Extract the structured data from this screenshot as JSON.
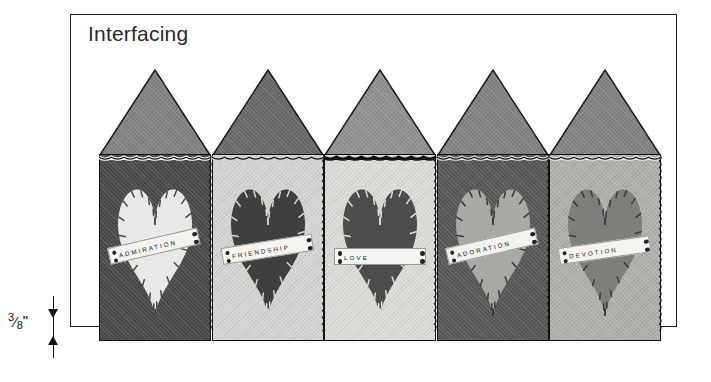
{
  "diagram": {
    "title": "Interfacing",
    "measurement": {
      "value": "3/8\"",
      "numerator": "3",
      "denominator": "8",
      "unit": "\""
    }
  },
  "panels": [
    {
      "index": 1,
      "label": "ADMIRATION",
      "body_color": "#4a4a4a",
      "roof_color": "#8a8a8a",
      "heart_color": "#e8e8e6",
      "stitch_color": "#4a4a4a",
      "scallop_color": "#ffffff",
      "tag_color": "#f2f2ee",
      "label_rotation": -13
    },
    {
      "index": 2,
      "label": "FRIENDSHIP",
      "body_color": "#d5d5d2",
      "roof_color": "#707070",
      "heart_color": "#3f3f3f",
      "stitch_color": "#d5d5d2",
      "scallop_color": "#d5d5d2",
      "tag_color": "#f4f4f0",
      "label_rotation": -9
    },
    {
      "index": 3,
      "label": "LOVE",
      "body_color": "#dcdcd8",
      "roof_color": "#9a9a9a",
      "heart_color": "#4c4c4c",
      "stitch_color": "#dcdcd8",
      "scallop_color": "#141414",
      "tag_color": "#f4f4f0",
      "label_rotation": 0
    },
    {
      "index": 4,
      "label": "ADORATION",
      "body_color": "#585858",
      "roof_color": "#8a8a8a",
      "heart_color": "#a8a8a4",
      "stitch_color": "#3a3a3a",
      "scallop_color": "#e6e6e2",
      "tag_color": "#f2f2ee",
      "label_rotation": -13
    },
    {
      "index": 5,
      "label": "DEVOTION",
      "body_color": "#b0b0ac",
      "roof_color": "#8a8a8a",
      "heart_color": "#7e7e7a",
      "stitch_color": "#3a3a3a",
      "scallop_color": "#e8e8e4",
      "tag_color": "#f4f4f0",
      "label_rotation": -8
    }
  ]
}
